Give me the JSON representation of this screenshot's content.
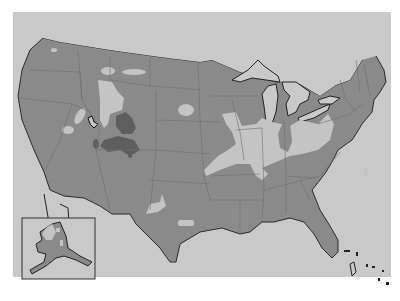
{
  "map": {
    "type": "choropleth-style region map",
    "subject": "Contiguous United States with Alaska inset",
    "colors": {
      "page_background": "#ffffff",
      "map_background": "#c8c8c8",
      "land_region": "#8a8a8a",
      "light_region": "#c4c4c4",
      "dark_region": "#5e5e5e",
      "border": "#222222",
      "state_lines": "#6e6e6e"
    },
    "regions": [
      {
        "name": "base-land",
        "shade": "medium"
      },
      {
        "name": "northern-plains-light",
        "shade": "light"
      },
      {
        "name": "ohio-valley-light",
        "shade": "light"
      },
      {
        "name": "rockies-dark",
        "shade": "dark"
      },
      {
        "name": "indiana-dark",
        "shade": "medium"
      }
    ],
    "inset": {
      "name": "alaska-inset",
      "label": ""
    }
  }
}
